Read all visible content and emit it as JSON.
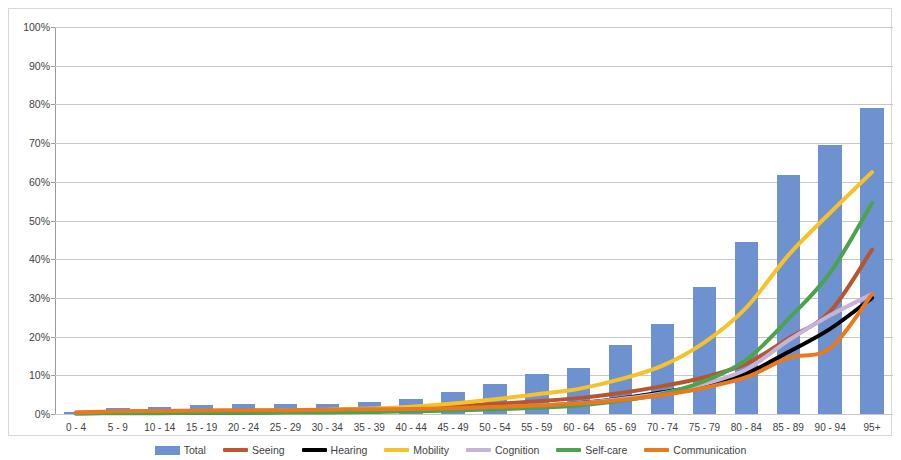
{
  "chart_data": {
    "type": "bar",
    "title": "",
    "xlabel": "",
    "ylabel": "",
    "ylim": [
      0,
      100
    ],
    "ytick_labels": [
      "0%",
      "10%",
      "20%",
      "30%",
      "40%",
      "50%",
      "60%",
      "70%",
      "80%",
      "90%",
      "100%"
    ],
    "ytick_values": [
      0,
      10,
      20,
      30,
      40,
      50,
      60,
      70,
      80,
      90,
      100
    ],
    "grid": true,
    "legend_position": "bottom",
    "categories": [
      "0 - 4",
      "5 - 9",
      "10 - 14",
      "15 - 19",
      "20 - 24",
      "25 - 29",
      "30 - 34",
      "35 - 39",
      "40 - 44",
      "45 - 49",
      "50 - 54",
      "55 - 59",
      "60 - 64",
      "65 - 69",
      "70 - 74",
      "75 - 79",
      "80 - 84",
      "85 - 89",
      "90 - 94",
      "95+"
    ],
    "series": [
      {
        "name": "Total",
        "kind": "bar",
        "color": "#6e92cf",
        "values": [
          0.5,
          1.6,
          1.8,
          2.3,
          2.5,
          2.6,
          2.7,
          3.0,
          3.9,
          5.8,
          7.8,
          10.3,
          11.8,
          17.8,
          23.2,
          32.7,
          44.5,
          61.8,
          69.5,
          79.2
        ]
      },
      {
        "name": "Seeing",
        "kind": "line",
        "color": "#b5562f",
        "values": [
          0.3,
          0.5,
          0.6,
          0.7,
          0.8,
          0.9,
          1.0,
          1.2,
          1.5,
          2.0,
          2.6,
          3.3,
          4.1,
          5.4,
          7.2,
          9.5,
          13.0,
          19.5,
          26.5,
          42.5
        ]
      },
      {
        "name": "Hearing",
        "kind": "line",
        "color": "#000000",
        "values": [
          0.2,
          0.3,
          0.3,
          0.4,
          0.4,
          0.5,
          0.6,
          0.7,
          0.9,
          1.2,
          1.6,
          2.1,
          2.8,
          4.0,
          5.6,
          7.6,
          10.5,
          16.0,
          22.0,
          30.0
        ]
      },
      {
        "name": "Mobility",
        "kind": "line",
        "color": "#f5c22b",
        "values": [
          0.2,
          0.4,
          0.5,
          0.6,
          0.8,
          0.9,
          1.1,
          1.4,
          1.9,
          2.7,
          3.8,
          5.1,
          6.5,
          9.0,
          12.5,
          18.5,
          27.5,
          41.0,
          52.0,
          62.5
        ]
      },
      {
        "name": "Cognition",
        "kind": "line",
        "color": "#c5b3d9",
        "values": [
          0.2,
          0.3,
          0.4,
          0.5,
          0.6,
          0.6,
          0.7,
          0.8,
          1.0,
          1.3,
          1.7,
          2.2,
          2.8,
          3.9,
          5.4,
          7.8,
          11.5,
          19.0,
          25.5,
          31.0
        ]
      },
      {
        "name": "Self-care",
        "kind": "line",
        "color": "#4da34d",
        "values": [
          0.1,
          0.2,
          0.2,
          0.3,
          0.3,
          0.4,
          0.4,
          0.5,
          0.7,
          0.9,
          1.2,
          1.6,
          2.2,
          3.4,
          5.2,
          8.5,
          14.0,
          24.5,
          36.5,
          54.5
        ]
      },
      {
        "name": "Communication",
        "kind": "line",
        "color": "#e8791f",
        "values": [
          0.4,
          0.7,
          0.8,
          0.9,
          1.0,
          1.0,
          1.1,
          1.2,
          1.3,
          1.5,
          1.8,
          2.2,
          2.7,
          3.6,
          4.9,
          6.8,
          9.5,
          14.5,
          17.0,
          31.0
        ]
      }
    ]
  },
  "legend": {
    "items": [
      {
        "label": "Total",
        "color": "#6e92cf",
        "marker": "bar"
      },
      {
        "label": "Seeing",
        "color": "#c0562f",
        "marker": "line"
      },
      {
        "label": "Hearing",
        "color": "#000000",
        "marker": "line"
      },
      {
        "label": "Mobility",
        "color": "#f5c22b",
        "marker": "line"
      },
      {
        "label": "Cognition",
        "color": "#c5b3d9",
        "marker": "line"
      },
      {
        "label": "Self-care",
        "color": "#4da34d",
        "marker": "line"
      },
      {
        "label": "Communication",
        "color": "#e8791f",
        "marker": "line"
      }
    ]
  }
}
